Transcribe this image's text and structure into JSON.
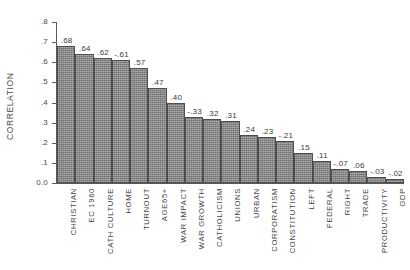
{
  "chart_data": {
    "type": "bar",
    "title": "",
    "subtitle": "",
    "xlabel": "",
    "ylabel": "CORRELATION",
    "ylim": [
      0.0,
      0.8
    ],
    "ytick_labels": [
      "0.0",
      ".1",
      ".2",
      ".3",
      ".4",
      ".5",
      ".6",
      ".7",
      ".8"
    ],
    "ytick_values": [
      0.0,
      0.1,
      0.2,
      0.3,
      0.4,
      0.5,
      0.6,
      0.7,
      0.8
    ],
    "grid": false,
    "legend": null,
    "note": "Bar heights show absolute correlation; printed labels show signed value.",
    "categories": [
      "CHRISTIAN",
      "EC 1960",
      "CATH CULTURE",
      "HOME",
      "TURNOUT",
      "AGE65+",
      "WAR IMPACT",
      "WAR GROWTH",
      "CATHOLICISM",
      "UNIONS",
      "URBAN",
      "CORPORATISM",
      "CONSTITUTION",
      "LEFT",
      "FEDERAL",
      "RIGHT",
      "TRADE",
      "PRODUCTIVITY",
      "GDP"
    ],
    "values": [
      0.68,
      0.64,
      0.62,
      -0.61,
      0.57,
      0.47,
      0.4,
      -0.33,
      0.32,
      0.31,
      0.24,
      0.23,
      -0.21,
      0.15,
      0.11,
      -0.07,
      0.06,
      -0.03,
      -0.02
    ],
    "value_labels": [
      ".68",
      ".64",
      ".62",
      "-.61",
      ".57",
      ".47",
      ".40",
      "-.33",
      ".32",
      ".31",
      ".24",
      ".23",
      "-.21",
      ".15",
      ".11",
      "-.07",
      ".06",
      "-.03",
      "-.02"
    ],
    "bar_color": "#8f8f8f",
    "bar_edge_color": "#4d4d4d",
    "axis_color": "#5a5a5a",
    "background_color": "#ffffff"
  }
}
